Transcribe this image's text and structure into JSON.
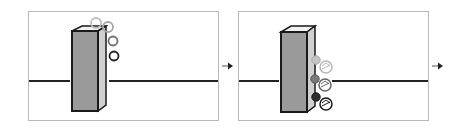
{
  "diagram": {
    "panels": [
      {
        "id": "step-1",
        "elements": [
          "membrane-line",
          "pillar",
          "rings-x4"
        ],
        "ring_colors": [
          "#bfbfbf",
          "#a6a6a6",
          "#6f6f6f",
          "#1f1f1f"
        ]
      },
      {
        "id": "step-2",
        "elements": [
          "membrane-line",
          "pillar",
          "bound-spheres-x3"
        ],
        "sphere_colors": [
          "#c4c4c4",
          "#7a7a7a",
          "#2e2e2e"
        ]
      }
    ],
    "arrows": [
      "arrow-between-panels",
      "arrow-after-panel-2"
    ]
  },
  "colors": {
    "panel_border": "#b8b8b8",
    "membrane": "#222222",
    "pillar_front": "#9a9a9a",
    "pillar_side": "#d0d0d0",
    "pillar_top": "#f2f2f2",
    "outline": "#1a1a1a"
  }
}
